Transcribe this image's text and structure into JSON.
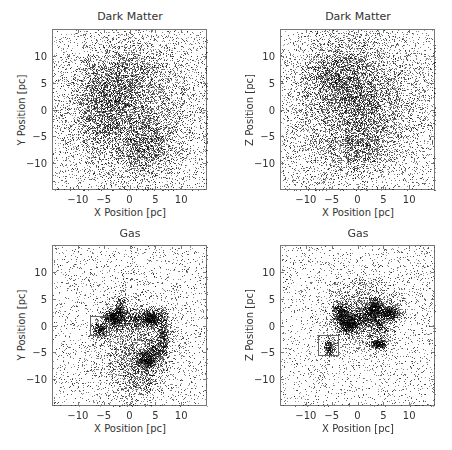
{
  "chart_data": [
    {
      "type": "scatter",
      "id": "dm_xy",
      "title": "Dark Matter",
      "xlabel": "X Position [pc]",
      "ylabel": "Y Position [pc]",
      "xlim": [
        -15,
        15
      ],
      "ylim": [
        -15,
        15
      ],
      "xticks": [
        -10,
        -5,
        0,
        5,
        10
      ],
      "yticks": [
        -10,
        -5,
        0,
        5,
        10
      ],
      "grid": false,
      "frame_px": {
        "left": 52,
        "top": 29,
        "width": 155,
        "height": 161
      },
      "density_components": [
        {
          "cx": 0,
          "cy": 0,
          "sx": 8.5,
          "sy": 8.5,
          "n": 5200
        },
        {
          "cx": -5,
          "cy": 0.5,
          "sx": 3.0,
          "sy": 4.5,
          "n": 1500
        },
        {
          "cx": 3,
          "cy": -6.5,
          "sx": 3.0,
          "sy": 3.0,
          "n": 1000
        },
        {
          "cx": -1,
          "cy": 6,
          "sx": 4.0,
          "sy": 3.5,
          "n": 900
        },
        {
          "cx": 0,
          "cy": 0,
          "sx": 30,
          "sy": 30,
          "n": 1800,
          "uniform": true
        }
      ],
      "selection_box": null
    },
    {
      "type": "scatter",
      "id": "dm_xz",
      "title": "Dark Matter",
      "xlabel": "X Position [pc]",
      "ylabel": "Z Position [pc]",
      "xlim": [
        -15,
        15
      ],
      "ylim": [
        -15,
        15
      ],
      "xticks": [
        -10,
        -5,
        0,
        5,
        10
      ],
      "yticks": [
        -10,
        -5,
        0,
        5,
        10
      ],
      "grid": false,
      "frame_px": {
        "left": 280,
        "top": 29,
        "width": 155,
        "height": 161
      },
      "density_components": [
        {
          "cx": -1,
          "cy": 1,
          "sx": 8.5,
          "sy": 8.5,
          "n": 5200
        },
        {
          "cx": -4,
          "cy": 6,
          "sx": 3.5,
          "sy": 3.5,
          "n": 1500
        },
        {
          "cx": 0,
          "cy": -6,
          "sx": 3.5,
          "sy": 3.0,
          "n": 1000
        },
        {
          "cx": 2,
          "cy": 2,
          "sx": 3.5,
          "sy": 3.5,
          "n": 700
        },
        {
          "cx": 0,
          "cy": 0,
          "sx": 30,
          "sy": 30,
          "n": 1800,
          "uniform": true
        }
      ],
      "selection_box": null
    },
    {
      "type": "scatter",
      "id": "gas_xy",
      "title": "Gas",
      "xlabel": "X Position [pc]",
      "ylabel": "Y Position [pc]",
      "xlim": [
        -15,
        15
      ],
      "ylim": [
        -15,
        15
      ],
      "xticks": [
        -10,
        -5,
        0,
        5,
        10
      ],
      "yticks": [
        -10,
        -5,
        0,
        5,
        10
      ],
      "grid": false,
      "frame_px": {
        "left": 52,
        "top": 245,
        "width": 155,
        "height": 161
      },
      "density_components": [
        {
          "cx": 0,
          "cy": 0,
          "sx": 30,
          "sy": 30,
          "n": 2200,
          "uniform": true
        },
        {
          "cx": 0.5,
          "cy": -4,
          "sx": 4.0,
          "sy": 5.0,
          "n": 1800
        },
        {
          "cx": 2,
          "cy": -9.5,
          "sx": 2.5,
          "sy": 2.0,
          "n": 400
        },
        {
          "cx": -3.3,
          "cy": 1.7,
          "sx": 1.0,
          "sy": 0.9,
          "n": 700
        },
        {
          "cx": -2,
          "cy": 3.5,
          "sx": 0.5,
          "sy": 1.0,
          "n": 200
        },
        {
          "cx": -6,
          "cy": -0.5,
          "sx": 0.7,
          "sy": 0.7,
          "n": 300
        },
        {
          "cx": 0.5,
          "cy": 1.5,
          "sx": 2.5,
          "sy": 1.0,
          "n": 600
        },
        {
          "cx": 4,
          "cy": 1.5,
          "sx": 0.9,
          "sy": 0.9,
          "n": 550
        },
        {
          "cx": 6.3,
          "cy": -1.5,
          "sx": 0.6,
          "sy": 2.5,
          "n": 500
        },
        {
          "cx": 3,
          "cy": -6,
          "sx": 1.0,
          "sy": 0.9,
          "n": 550
        },
        {
          "cx": 4.5,
          "cy": -4.5,
          "sx": 0.8,
          "sy": 1.2,
          "n": 250
        }
      ],
      "selection_box": {
        "x0": -7.6,
        "x1": -3.7,
        "y0": -2.0,
        "y1": 1.85
      }
    },
    {
      "type": "scatter",
      "id": "gas_xz",
      "title": "Gas",
      "xlabel": "X Position [pc]",
      "ylabel": "Z Position [pc]",
      "xlim": [
        -15,
        15
      ],
      "ylim": [
        -15,
        15
      ],
      "xticks": [
        -10,
        -5,
        0,
        5,
        10
      ],
      "yticks": [
        -10,
        -5,
        0,
        5,
        10
      ],
      "grid": false,
      "frame_px": {
        "left": 280,
        "top": 245,
        "width": 155,
        "height": 161
      },
      "density_components": [
        {
          "cx": 0,
          "cy": 0,
          "sx": 30,
          "sy": 30,
          "n": 2200,
          "uniform": true
        },
        {
          "cx": 1,
          "cy": 2.5,
          "sx": 4.0,
          "sy": 3.5,
          "n": 1600
        },
        {
          "cx": -3.5,
          "cy": 2.5,
          "sx": 0.8,
          "sy": 1.0,
          "n": 500
        },
        {
          "cx": -2,
          "cy": 0.5,
          "sx": 1.0,
          "sy": 1.0,
          "n": 600
        },
        {
          "cx": 0.5,
          "cy": 1.5,
          "sx": 2.0,
          "sy": 1.0,
          "n": 550
        },
        {
          "cx": 3,
          "cy": 3.3,
          "sx": 0.9,
          "sy": 1.0,
          "n": 550
        },
        {
          "cx": 6,
          "cy": 2.6,
          "sx": 1.0,
          "sy": 0.6,
          "n": 450
        },
        {
          "cx": 4.5,
          "cy": 0.5,
          "sx": 1.0,
          "sy": 1.5,
          "n": 300
        },
        {
          "cx": 3.7,
          "cy": -3.2,
          "sx": 0.8,
          "sy": 0.5,
          "n": 350
        },
        {
          "cx": -5.7,
          "cy": -3.8,
          "sx": 0.5,
          "sy": 0.8,
          "n": 250
        }
      ],
      "selection_box": {
        "x0": -7.6,
        "x1": -3.5,
        "y0": -5.7,
        "y1": -1.7
      }
    }
  ],
  "colors": {
    "point": "#000000",
    "frame": "#777777",
    "text": "#333333",
    "box": "#666666"
  }
}
